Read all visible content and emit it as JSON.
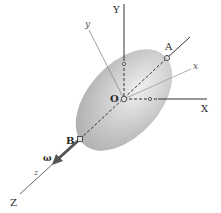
{
  "figure": {
    "type": "rigid-body-rotation-diagram",
    "labels": {
      "Y_axis": "Y",
      "X_axis": "X",
      "Z_axis": "Z",
      "y_body": "y",
      "x_body": "x",
      "z_body": "z",
      "origin": "O",
      "point_A": "A",
      "point_B": "B",
      "angular_velocity": "ω"
    },
    "colors": {
      "body_fill": "#b9b9b9",
      "body_highlight": "#e6e6e6",
      "axis_line": "#333333",
      "body_axis_line": "#9a9a9a",
      "vector_arrow": "#555555"
    }
  }
}
